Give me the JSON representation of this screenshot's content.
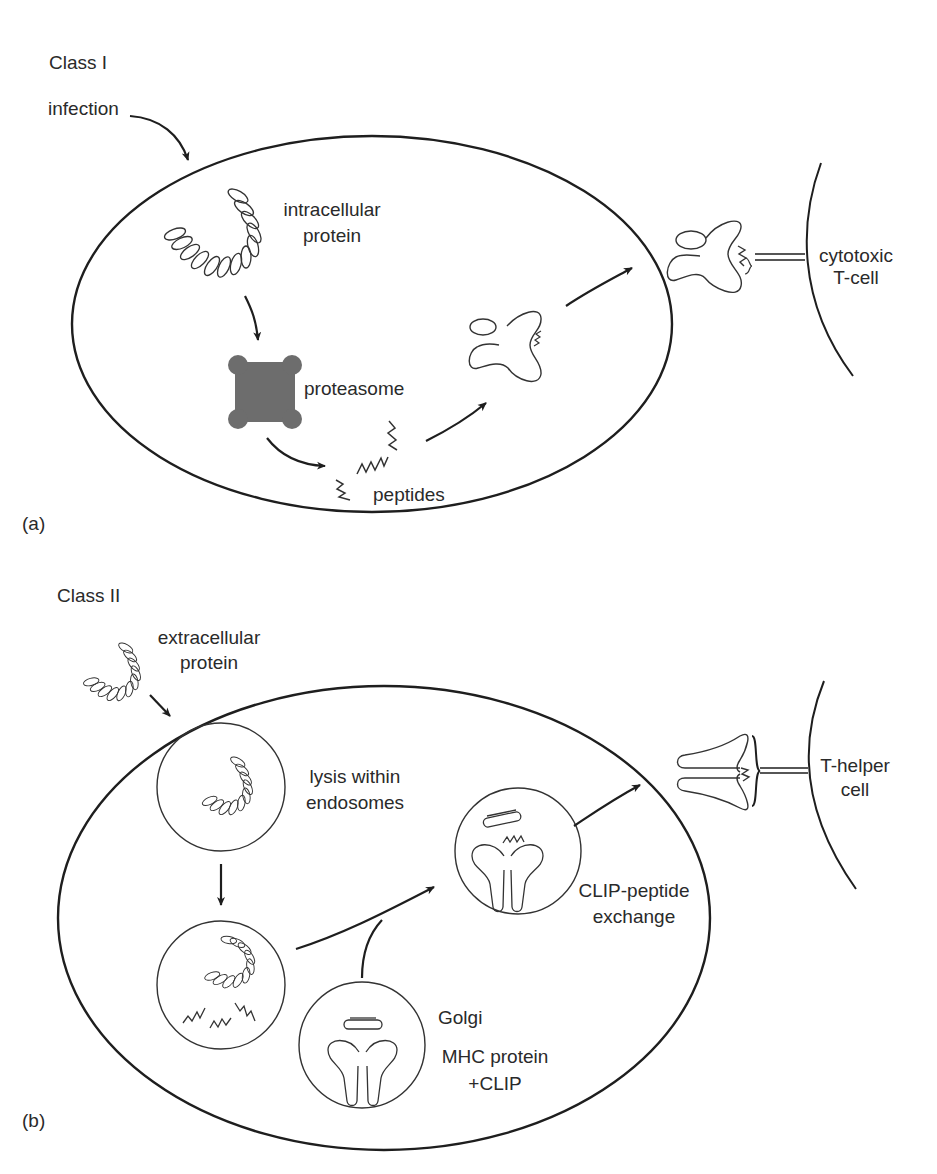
{
  "panel_a": {
    "title": "Class I",
    "panel_label": "(a)",
    "labels": {
      "infection": "infection",
      "intracellular_line1": "intracellular",
      "intracellular_line2": "protein",
      "proteasome": "proteasome",
      "peptides": "peptides",
      "tcell_line1": "cytotoxic",
      "tcell_line2": "T-cell"
    }
  },
  "panel_b": {
    "title": "Class II",
    "panel_label": "(b)",
    "labels": {
      "extracellular_line1": "extracellular",
      "extracellular_line2": "protein",
      "lysis_line1": "lysis within",
      "lysis_line2": "endosomes",
      "exchange_line1": "CLIP-peptide",
      "exchange_line2": "exchange",
      "golgi": "Golgi",
      "mhc_line1": "MHC protein",
      "mhc_line2": "+CLIP",
      "tcell_line1": "T-helper",
      "tcell_line2": "cell"
    }
  },
  "colors": {
    "line": "#1e1e1e",
    "proteasome_fill": "#6d6d6d",
    "background": "#ffffff"
  }
}
